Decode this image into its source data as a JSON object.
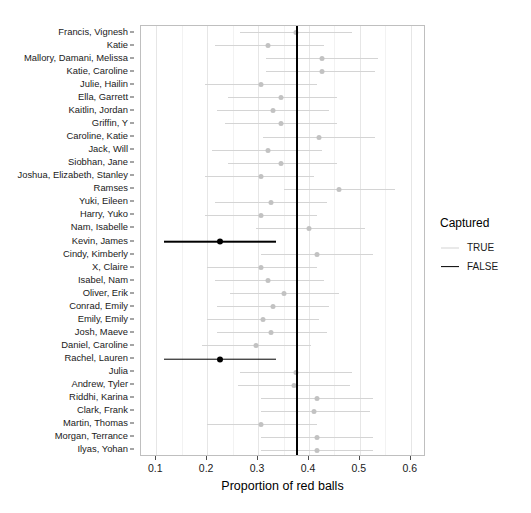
{
  "chart_data": {
    "type": "scatter",
    "title": "",
    "xlabel": "Proportion of red balls",
    "ylabel": "",
    "xlim": [
      0.07,
      0.63
    ],
    "xticks": [
      0.1,
      0.2,
      0.3,
      0.4,
      0.5,
      0.6
    ],
    "xtick_labels": [
      "0.1",
      "0.2",
      "0.3",
      "0.4",
      "0.5",
      "0.6"
    ],
    "x_minor_ticks": [
      0.15,
      0.25,
      0.35,
      0.45,
      0.55
    ],
    "grid": "vertical-only",
    "legend_position": "right",
    "reference_line": {
      "name": "true-proportion-line",
      "x": 0.375,
      "color": "#000000"
    },
    "legend": {
      "title": "Captured",
      "entries": [
        {
          "label": "TRUE",
          "color": "#d4d4d4"
        },
        {
          "label": "FALSE",
          "color": "#000000"
        }
      ]
    },
    "categories": [
      "Francis, Vignesh",
      "Katie",
      "Mallory, Damani, Melissa",
      "Katie, Caroline",
      "Julie, Hailin",
      "Ella, Garrett",
      "Kaitlin, Jordan",
      "Griffin, Y",
      "Caroline, Katie",
      "Jack, Will",
      "Siobhan, Jane",
      "Joshua, Elizabeth, Stanley",
      "Ramses",
      "Yuki, Eileen",
      "Harry, Yuko",
      "Nam, Isabelle",
      "Kevin, James",
      "Cindy, Kimberly",
      "X, Claire",
      "Isabel, Nam",
      "Oliver, Erik",
      "Conrad, Emily",
      "Emily, Emily",
      "Josh, Maeve",
      "Daniel, Caroline",
      "Rachel, Lauren",
      "Julia",
      "Andrew, Tyler",
      "Riddhi, Karina",
      "Clark, Frank",
      "Martin, Thomas",
      "Morgan, Terrance",
      "Ilyas, Yohan"
    ],
    "intervals": [
      {
        "name": "Francis, Vignesh",
        "estimate": 0.375,
        "lower": 0.265,
        "upper": 0.485,
        "captured": "TRUE"
      },
      {
        "name": "Katie",
        "estimate": 0.32,
        "lower": 0.215,
        "upper": 0.43,
        "captured": "TRUE"
      },
      {
        "name": "Mallory, Damani, Melissa",
        "estimate": 0.425,
        "lower": 0.315,
        "upper": 0.535,
        "captured": "TRUE"
      },
      {
        "name": "Katie, Caroline",
        "estimate": 0.425,
        "lower": 0.315,
        "upper": 0.53,
        "captured": "TRUE"
      },
      {
        "name": "Julie, Hailin",
        "estimate": 0.305,
        "lower": 0.195,
        "upper": 0.415,
        "captured": "TRUE"
      },
      {
        "name": "Ella, Garrett",
        "estimate": 0.345,
        "lower": 0.24,
        "upper": 0.455,
        "captured": "TRUE"
      },
      {
        "name": "Kaitlin, Jordan",
        "estimate": 0.33,
        "lower": 0.22,
        "upper": 0.44,
        "captured": "TRUE"
      },
      {
        "name": "Griffin, Y",
        "estimate": 0.345,
        "lower": 0.235,
        "upper": 0.455,
        "captured": "TRUE"
      },
      {
        "name": "Caroline, Katie",
        "estimate": 0.42,
        "lower": 0.31,
        "upper": 0.53,
        "captured": "TRUE"
      },
      {
        "name": "Jack, Will",
        "estimate": 0.32,
        "lower": 0.21,
        "upper": 0.425,
        "captured": "TRUE"
      },
      {
        "name": "Siobhan, Jane",
        "estimate": 0.345,
        "lower": 0.24,
        "upper": 0.455,
        "captured": "TRUE"
      },
      {
        "name": "Joshua, Elizabeth, Stanley",
        "estimate": 0.305,
        "lower": 0.195,
        "upper": 0.41,
        "captured": "TRUE"
      },
      {
        "name": "Ramses",
        "estimate": 0.46,
        "lower": 0.35,
        "upper": 0.57,
        "captured": "TRUE"
      },
      {
        "name": "Yuki, Eileen",
        "estimate": 0.325,
        "lower": 0.215,
        "upper": 0.435,
        "captured": "TRUE"
      },
      {
        "name": "Harry, Yuko",
        "estimate": 0.305,
        "lower": 0.195,
        "upper": 0.415,
        "captured": "TRUE"
      },
      {
        "name": "Nam, Isabelle",
        "estimate": 0.4,
        "lower": 0.295,
        "upper": 0.51,
        "captured": "TRUE"
      },
      {
        "name": "Kevin, James",
        "estimate": 0.225,
        "lower": 0.115,
        "upper": 0.335,
        "captured": "FALSE"
      },
      {
        "name": "Cindy, Kimberly",
        "estimate": 0.415,
        "lower": 0.305,
        "upper": 0.525,
        "captured": "TRUE"
      },
      {
        "name": "X, Claire",
        "estimate": 0.305,
        "lower": 0.2,
        "upper": 0.415,
        "captured": "TRUE"
      },
      {
        "name": "Isabel, Nam",
        "estimate": 0.32,
        "lower": 0.215,
        "upper": 0.43,
        "captured": "TRUE"
      },
      {
        "name": "Oliver, Erik",
        "estimate": 0.35,
        "lower": 0.245,
        "upper": 0.46,
        "captured": "TRUE"
      },
      {
        "name": "Conrad, Emily",
        "estimate": 0.33,
        "lower": 0.22,
        "upper": 0.44,
        "captured": "TRUE"
      },
      {
        "name": "Emily, Emily",
        "estimate": 0.31,
        "lower": 0.2,
        "upper": 0.42,
        "captured": "TRUE"
      },
      {
        "name": "Josh, Maeve",
        "estimate": 0.325,
        "lower": 0.22,
        "upper": 0.435,
        "captured": "TRUE"
      },
      {
        "name": "Daniel, Caroline",
        "estimate": 0.295,
        "lower": 0.19,
        "upper": 0.405,
        "captured": "TRUE"
      },
      {
        "name": "Rachel, Lauren",
        "estimate": 0.225,
        "lower": 0.115,
        "upper": 0.335,
        "captured": "FALSE"
      },
      {
        "name": "Julia",
        "estimate": 0.375,
        "lower": 0.265,
        "upper": 0.485,
        "captured": "TRUE"
      },
      {
        "name": "Andrew, Tyler",
        "estimate": 0.37,
        "lower": 0.26,
        "upper": 0.48,
        "captured": "TRUE"
      },
      {
        "name": "Riddhi, Karina",
        "estimate": 0.415,
        "lower": 0.305,
        "upper": 0.525,
        "captured": "TRUE"
      },
      {
        "name": "Clark, Frank",
        "estimate": 0.41,
        "lower": 0.305,
        "upper": 0.52,
        "captured": "TRUE"
      },
      {
        "name": "Martin, Thomas",
        "estimate": 0.305,
        "lower": 0.2,
        "upper": 0.415,
        "captured": "TRUE"
      },
      {
        "name": "Morgan, Terrance",
        "estimate": 0.415,
        "lower": 0.305,
        "upper": 0.525,
        "captured": "TRUE"
      },
      {
        "name": "Ilyas, Yohan",
        "estimate": 0.415,
        "lower": 0.305,
        "upper": 0.525,
        "captured": "TRUE"
      }
    ]
  }
}
